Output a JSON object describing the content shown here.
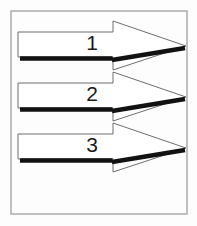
{
  "figure": {
    "background_color": "#fdfdfd",
    "frame": {
      "name": "outer-border",
      "stroke_color": "#a0a0a0",
      "fill_color": "#fefefe",
      "x": 11,
      "y": 11,
      "width": 176,
      "height": 203
    },
    "arrow_outline_color": "#6e6e6e",
    "arrow_fill_color": "#ffffff",
    "arrow_shadow_color": "#121212",
    "arrows": [
      {
        "label": "1",
        "name": "arrow-1",
        "body_top": 32,
        "body_bottom": 57,
        "body_left": 18,
        "body_right": 113,
        "head_top": 21,
        "head_bottom": 70,
        "tip_x": 186,
        "tip_y": 46,
        "notch_x": 113,
        "notch_y": 59,
        "label_x": 92,
        "label_y": 44
      },
      {
        "label": "2",
        "name": "arrow-2",
        "body_top": 83,
        "body_bottom": 108,
        "body_left": 18,
        "body_right": 113,
        "head_top": 72,
        "head_bottom": 121,
        "tip_x": 186,
        "tip_y": 97,
        "notch_x": 113,
        "notch_y": 110,
        "label_x": 92,
        "label_y": 95
      },
      {
        "label": "3",
        "name": "arrow-3",
        "body_top": 134,
        "body_bottom": 159,
        "body_left": 18,
        "body_right": 113,
        "head_top": 123,
        "head_bottom": 172,
        "tip_x": 186,
        "tip_y": 148,
        "notch_x": 113,
        "notch_y": 161,
        "label_x": 92,
        "label_y": 146
      }
    ]
  }
}
